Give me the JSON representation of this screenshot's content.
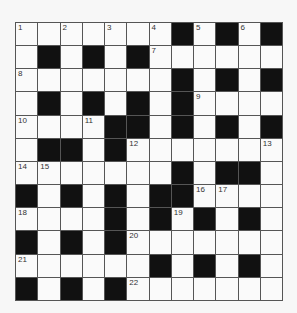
{
  "puzzle": {
    "rows": 12,
    "cols": 12,
    "colors": {
      "black": "#111111",
      "white": "#fafafa",
      "border": "#555555"
    },
    "layout": [
      "WWWWWWWBWBWB",
      "WBWBWBWWWWWW",
      "WWWWWWWBWBWB",
      "WBWBWBWBWWWW",
      "WWWWBBWBWBWB",
      "WBBWBWWWWWWW",
      "WWWWWWWBWBBW",
      "BWBWBWBBWWWW",
      "WWWWBWBWBWBW",
      "BWBWBWWWWWWW",
      "WWWWWWBWBWBW",
      "BWBWBWWWWWWW"
    ],
    "numbers": [
      {
        "row": 0,
        "col": 0,
        "n": "1"
      },
      {
        "row": 0,
        "col": 2,
        "n": "2"
      },
      {
        "row": 0,
        "col": 4,
        "n": "3"
      },
      {
        "row": 0,
        "col": 6,
        "n": "4"
      },
      {
        "row": 0,
        "col": 8,
        "n": "5"
      },
      {
        "row": 0,
        "col": 10,
        "n": "6"
      },
      {
        "row": 1,
        "col": 6,
        "n": "7"
      },
      {
        "row": 2,
        "col": 0,
        "n": "8"
      },
      {
        "row": 3,
        "col": 8,
        "n": "9"
      },
      {
        "row": 4,
        "col": 0,
        "n": "10"
      },
      {
        "row": 4,
        "col": 3,
        "n": "11"
      },
      {
        "row": 5,
        "col": 5,
        "n": "12"
      },
      {
        "row": 5,
        "col": 11,
        "n": "13"
      },
      {
        "row": 6,
        "col": 0,
        "n": "14"
      },
      {
        "row": 6,
        "col": 1,
        "n": "15"
      },
      {
        "row": 7,
        "col": 8,
        "n": "16"
      },
      {
        "row": 7,
        "col": 9,
        "n": "17"
      },
      {
        "row": 8,
        "col": 0,
        "n": "18"
      },
      {
        "row": 8,
        "col": 7,
        "n": "19"
      },
      {
        "row": 9,
        "col": 5,
        "n": "20"
      },
      {
        "row": 10,
        "col": 0,
        "n": "21"
      },
      {
        "row": 11,
        "col": 5,
        "n": "22"
      }
    ]
  }
}
